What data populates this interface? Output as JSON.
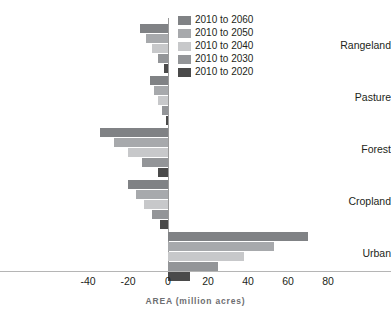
{
  "chart_data": {
    "type": "bar",
    "orientation": "horizontal",
    "title": "",
    "xlabel": "AREA (million acres)",
    "ylabel": "",
    "categories": [
      "Rangeland",
      "Pasture",
      "Forest",
      "Cropland",
      "Urban"
    ],
    "xlim": [
      -50,
      90
    ],
    "xticks": [
      -40,
      -20,
      0,
      20,
      40,
      60,
      80
    ],
    "xticklabels": [
      "-40",
      "-20",
      "0",
      "20",
      "40",
      "60",
      "80"
    ],
    "grid": false,
    "legend_position": "top-center",
    "series": [
      {
        "name": "2010 to 2060",
        "color": "#808285",
        "values": [
          -14.0,
          -9.0,
          -34.0,
          -20.0,
          70.0
        ]
      },
      {
        "name": "2010 to 2050",
        "color": "#a7a9ac",
        "values": [
          -11.0,
          -7.0,
          -27.0,
          -16.0,
          53.0
        ]
      },
      {
        "name": "2010 to 2040",
        "color": "#c7c8ca",
        "values": [
          -8.0,
          -5.0,
          -20.0,
          -12.0,
          38.0
        ]
      },
      {
        "name": "2010 to 2030",
        "color": "#939598",
        "values": [
          -5.0,
          -3.0,
          -13.0,
          -8.0,
          25.0
        ]
      },
      {
        "name": "2010 to 2020",
        "color": "#4a4a4a",
        "values": [
          -2.0,
          -1.0,
          -5.0,
          -4.0,
          11.0
        ]
      }
    ]
  },
  "legend": {
    "items": [
      {
        "label": "2010 to 2060",
        "color": "#808285"
      },
      {
        "label": "2010 to 2050",
        "color": "#a7a9ac"
      },
      {
        "label": "2010 to 2040",
        "color": "#c7c8ca"
      },
      {
        "label": "2010 to 2030",
        "color": "#939598"
      },
      {
        "label": "2010 to 2020",
        "color": "#4a4a4a"
      }
    ]
  },
  "axis": {
    "x_title": "AREA (million acres)"
  }
}
